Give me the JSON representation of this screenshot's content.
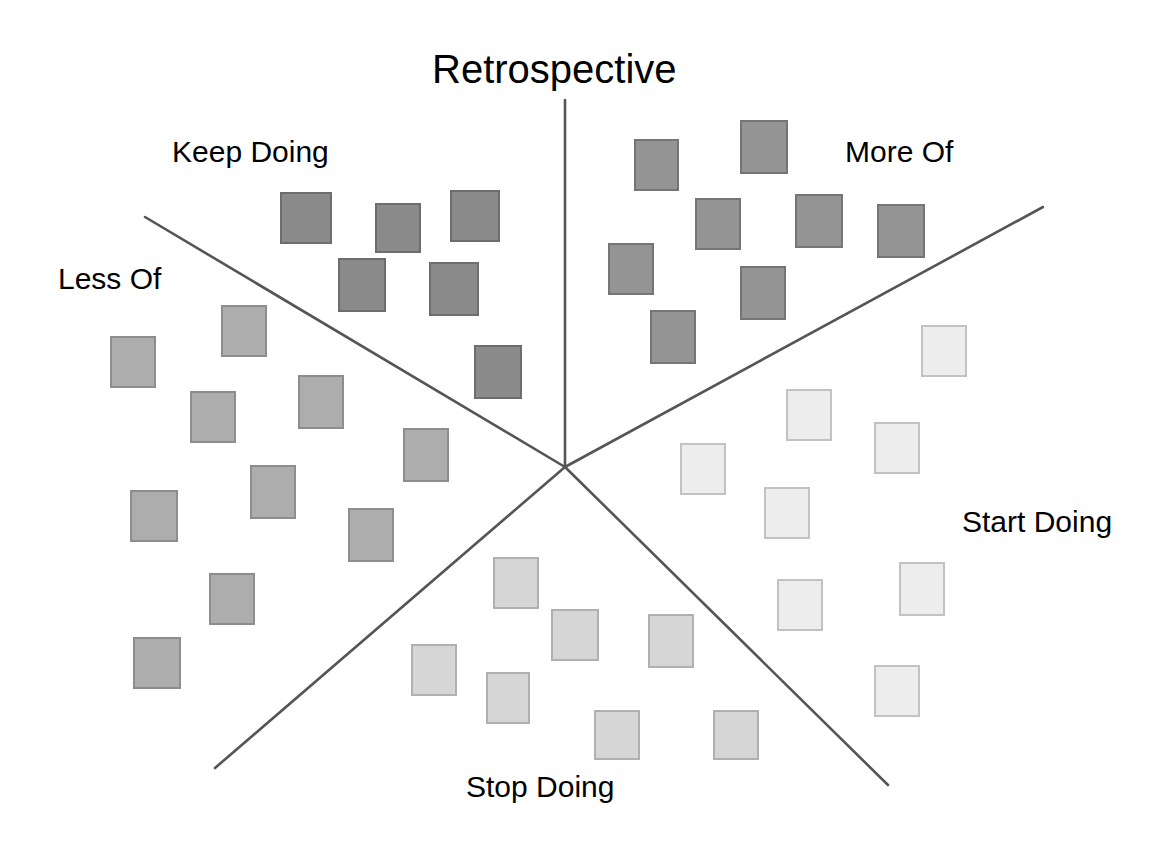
{
  "title": {
    "text": "Retrospective",
    "x": 432,
    "y": 47,
    "font_size": 40
  },
  "colors": {
    "background": "#ffffff",
    "text": "#000000",
    "line": "#555555",
    "keep_doing_fill": "#8a8a8a",
    "keep_doing_border": "#6d6d6d",
    "more_of_fill": "#949494",
    "more_of_border": "#757575",
    "less_of_fill": "#adadad",
    "less_of_border": "#8d8d8d",
    "stop_doing_fill": "#d6d6d6",
    "stop_doing_border": "#b0b0b0",
    "start_doing_fill": "#ededed",
    "start_doing_border": "#c2c2c2"
  },
  "center": {
    "x": 565,
    "y": 467
  },
  "sector_lines": [
    {
      "name": "line-top-vertical",
      "x1": 565,
      "y1": 100,
      "x2": 565,
      "y2": 467
    },
    {
      "name": "line-upper-left",
      "x1": 145,
      "y1": 217,
      "x2": 565,
      "y2": 467
    },
    {
      "name": "line-upper-right",
      "x1": 1043,
      "y1": 207,
      "x2": 565,
      "y2": 467
    },
    {
      "name": "line-lower-left",
      "x1": 215,
      "y1": 768,
      "x2": 565,
      "y2": 467
    },
    {
      "name": "line-lower-right",
      "x1": 888,
      "y1": 785,
      "x2": 565,
      "y2": 467
    }
  ],
  "sectors": [
    {
      "id": "keep-doing",
      "label": "Keep Doing",
      "label_x": 172,
      "label_y": 135,
      "note_count": 7
    },
    {
      "id": "more-of",
      "label": "More Of",
      "label_x": 845,
      "label_y": 135,
      "note_count": 9
    },
    {
      "id": "less-of",
      "label": "Less Of",
      "label_x": 58,
      "label_y": 262,
      "note_count": 9
    },
    {
      "id": "start-doing",
      "label": "Start Doing",
      "label_x": 962,
      "label_y": 505,
      "note_count": 9
    },
    {
      "id": "stop-doing",
      "label": "Stop Doing",
      "label_x": 466,
      "label_y": 770,
      "note_count": 8
    }
  ],
  "chart_data": {
    "type": "scatter",
    "title": "Retrospective",
    "xlabel": "",
    "ylabel": "",
    "xlim": [
      0,
      1165
    ],
    "ylim": [
      0,
      854
    ],
    "grid": false,
    "legend": "none",
    "series": [
      {
        "name": "Keep Doing",
        "fill": "#8a8a8a",
        "border": "#6d6d6d",
        "count": 7,
        "notes": [
          {
            "x": 280,
            "y": 192,
            "w": 52,
            "h": 52
          },
          {
            "x": 375,
            "y": 203,
            "w": 46,
            "h": 50
          },
          {
            "x": 450,
            "y": 190,
            "w": 50,
            "h": 52
          },
          {
            "x": 338,
            "y": 258,
            "w": 48,
            "h": 54
          },
          {
            "x": 429,
            "y": 262,
            "w": 50,
            "h": 54
          },
          {
            "x": 474,
            "y": 345,
            "w": 48,
            "h": 54
          }
        ]
      },
      {
        "name": "More Of",
        "fill": "#949494",
        "border": "#757575",
        "count": 9,
        "notes": [
          {
            "x": 634,
            "y": 139,
            "w": 45,
            "h": 52
          },
          {
            "x": 740,
            "y": 120,
            "w": 48,
            "h": 54
          },
          {
            "x": 695,
            "y": 198,
            "w": 46,
            "h": 52
          },
          {
            "x": 795,
            "y": 194,
            "w": 48,
            "h": 54
          },
          {
            "x": 877,
            "y": 204,
            "w": 48,
            "h": 54
          },
          {
            "x": 608,
            "y": 243,
            "w": 46,
            "h": 52
          },
          {
            "x": 740,
            "y": 266,
            "w": 46,
            "h": 54
          },
          {
            "x": 650,
            "y": 310,
            "w": 46,
            "h": 54
          }
        ]
      },
      {
        "name": "Less Of",
        "fill": "#adadad",
        "border": "#8d8d8d",
        "count": 9,
        "notes": [
          {
            "x": 221,
            "y": 305,
            "w": 46,
            "h": 52
          },
          {
            "x": 110,
            "y": 336,
            "w": 46,
            "h": 52
          },
          {
            "x": 190,
            "y": 391,
            "w": 46,
            "h": 52
          },
          {
            "x": 298,
            "y": 375,
            "w": 46,
            "h": 54
          },
          {
            "x": 403,
            "y": 428,
            "w": 46,
            "h": 54
          },
          {
            "x": 250,
            "y": 465,
            "w": 46,
            "h": 54
          },
          {
            "x": 130,
            "y": 490,
            "w": 48,
            "h": 52
          },
          {
            "x": 348,
            "y": 508,
            "w": 46,
            "h": 54
          },
          {
            "x": 209,
            "y": 573,
            "w": 46,
            "h": 52
          },
          {
            "x": 133,
            "y": 637,
            "w": 48,
            "h": 52
          }
        ]
      },
      {
        "name": "Stop Doing",
        "fill": "#d6d6d6",
        "border": "#b0b0b0",
        "count": 8,
        "notes": [
          {
            "x": 493,
            "y": 557,
            "w": 46,
            "h": 52
          },
          {
            "x": 551,
            "y": 609,
            "w": 48,
            "h": 52
          },
          {
            "x": 648,
            "y": 614,
            "w": 46,
            "h": 54
          },
          {
            "x": 411,
            "y": 644,
            "w": 46,
            "h": 52
          },
          {
            "x": 486,
            "y": 672,
            "w": 44,
            "h": 52
          },
          {
            "x": 594,
            "y": 710,
            "w": 46,
            "h": 50
          },
          {
            "x": 713,
            "y": 710,
            "w": 46,
            "h": 50
          }
        ]
      },
      {
        "name": "Start Doing",
        "fill": "#ededed",
        "border": "#c2c2c2",
        "count": 9,
        "notes": [
          {
            "x": 921,
            "y": 325,
            "w": 46,
            "h": 52
          },
          {
            "x": 786,
            "y": 389,
            "w": 46,
            "h": 52
          },
          {
            "x": 874,
            "y": 422,
            "w": 46,
            "h": 52
          },
          {
            "x": 680,
            "y": 443,
            "w": 46,
            "h": 52
          },
          {
            "x": 764,
            "y": 487,
            "w": 46,
            "h": 52
          },
          {
            "x": 899,
            "y": 562,
            "w": 46,
            "h": 54
          },
          {
            "x": 777,
            "y": 579,
            "w": 46,
            "h": 52
          },
          {
            "x": 874,
            "y": 665,
            "w": 46,
            "h": 52
          }
        ]
      }
    ]
  }
}
